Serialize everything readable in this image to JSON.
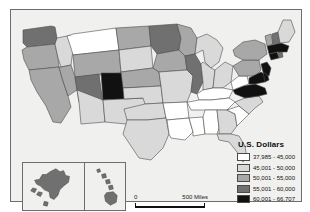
{
  "figure": {
    "background_color": "#ffffff",
    "map_background_color": "#f0f0ee",
    "frame_color": "#6d6d6d"
  },
  "legend": {
    "title": "U.S. Dollars",
    "classes": [
      {
        "label": "37,985 - 45,000",
        "color": "#ffffff",
        "min": 37985,
        "max": 45000
      },
      {
        "label": "45,001 - 50,000",
        "color": "#d9d9d9",
        "min": 45001,
        "max": 50000
      },
      {
        "label": "50,001 - 55,000",
        "color": "#a8a8a8",
        "min": 50001,
        "max": 55000
      },
      {
        "label": "55,001 - 60,000",
        "color": "#707070",
        "min": 55001,
        "max": 60000
      },
      {
        "label": "60,001 - 66,707",
        "color": "#111111",
        "min": 60001,
        "max": 66707
      }
    ]
  },
  "scale_bar": {
    "zero_label": "0",
    "max_label": "500 Miles",
    "units": "Miles",
    "max_value": 500
  },
  "chart_data": {
    "type": "choropleth",
    "title": "U.S. Dollars",
    "value_label": "U.S. Dollars",
    "classification": "5-class graduated grayscale",
    "data_min": 37985,
    "data_max": 66707,
    "class_breaks": [
      37985,
      45000,
      50000,
      55000,
      60000,
      66707
    ],
    "class_colors": [
      "#ffffff",
      "#d9d9d9",
      "#a8a8a8",
      "#707070",
      "#111111"
    ],
    "insets": [
      "Alaska",
      "Hawaii"
    ],
    "states": [
      {
        "code": "WA",
        "name": "Washington",
        "class": 4,
        "color": "#707070"
      },
      {
        "code": "OR",
        "name": "Oregon",
        "class": 3,
        "color": "#a8a8a8"
      },
      {
        "code": "CA",
        "name": "California",
        "class": 3,
        "color": "#a8a8a8"
      },
      {
        "code": "NV",
        "name": "Nevada",
        "class": 3,
        "color": "#a8a8a8"
      },
      {
        "code": "ID",
        "name": "Idaho",
        "class": 2,
        "color": "#d9d9d9"
      },
      {
        "code": "MT",
        "name": "Montana",
        "class": 1,
        "color": "#ffffff"
      },
      {
        "code": "WY",
        "name": "Wyoming",
        "class": 3,
        "color": "#a8a8a8"
      },
      {
        "code": "UT",
        "name": "Utah",
        "class": 4,
        "color": "#707070"
      },
      {
        "code": "AZ",
        "name": "Arizona",
        "class": 2,
        "color": "#d9d9d9"
      },
      {
        "code": "CO",
        "name": "Colorado",
        "class": 5,
        "color": "#111111"
      },
      {
        "code": "NM",
        "name": "New Mexico",
        "class": 2,
        "color": "#d9d9d9"
      },
      {
        "code": "ND",
        "name": "North Dakota",
        "class": 3,
        "color": "#a8a8a8"
      },
      {
        "code": "SD",
        "name": "South Dakota",
        "class": 2,
        "color": "#d9d9d9"
      },
      {
        "code": "NE",
        "name": "Nebraska",
        "class": 3,
        "color": "#a8a8a8"
      },
      {
        "code": "KS",
        "name": "Kansas",
        "class": 2,
        "color": "#d9d9d9"
      },
      {
        "code": "OK",
        "name": "Oklahoma",
        "class": 2,
        "color": "#d9d9d9"
      },
      {
        "code": "TX",
        "name": "Texas",
        "class": 2,
        "color": "#d9d9d9"
      },
      {
        "code": "MN",
        "name": "Minnesota",
        "class": 4,
        "color": "#707070"
      },
      {
        "code": "IA",
        "name": "Iowa",
        "class": 3,
        "color": "#a8a8a8"
      },
      {
        "code": "MO",
        "name": "Missouri",
        "class": 2,
        "color": "#d9d9d9"
      },
      {
        "code": "AR",
        "name": "Arkansas",
        "class": 1,
        "color": "#ffffff"
      },
      {
        "code": "LA",
        "name": "Louisiana",
        "class": 1,
        "color": "#ffffff"
      },
      {
        "code": "WI",
        "name": "Wisconsin",
        "class": 3,
        "color": "#a8a8a8"
      },
      {
        "code": "IL",
        "name": "Illinois",
        "class": 4,
        "color": "#707070"
      },
      {
        "code": "MS",
        "name": "Mississippi",
        "class": 1,
        "color": "#ffffff"
      },
      {
        "code": "MI",
        "name": "Michigan",
        "class": 2,
        "color": "#d9d9d9"
      },
      {
        "code": "IN",
        "name": "Indiana",
        "class": 2,
        "color": "#d9d9d9"
      },
      {
        "code": "OH",
        "name": "Ohio",
        "class": 2,
        "color": "#d9d9d9"
      },
      {
        "code": "KY",
        "name": "Kentucky",
        "class": 1,
        "color": "#ffffff"
      },
      {
        "code": "TN",
        "name": "Tennessee",
        "class": 1,
        "color": "#ffffff"
      },
      {
        "code": "AL",
        "name": "Alabama",
        "class": 1,
        "color": "#ffffff"
      },
      {
        "code": "GA",
        "name": "Georgia",
        "class": 2,
        "color": "#d9d9d9"
      },
      {
        "code": "FL",
        "name": "Florida",
        "class": 2,
        "color": "#d9d9d9"
      },
      {
        "code": "SC",
        "name": "South Carolina",
        "class": 1,
        "color": "#ffffff"
      },
      {
        "code": "NC",
        "name": "North Carolina",
        "class": 2,
        "color": "#d9d9d9"
      },
      {
        "code": "VA",
        "name": "Virginia",
        "class": 5,
        "color": "#111111"
      },
      {
        "code": "WV",
        "name": "West Virginia",
        "class": 1,
        "color": "#ffffff"
      },
      {
        "code": "PA",
        "name": "Pennsylvania",
        "class": 3,
        "color": "#a8a8a8"
      },
      {
        "code": "NY",
        "name": "New York",
        "class": 3,
        "color": "#a8a8a8"
      },
      {
        "code": "MD",
        "name": "Maryland",
        "class": 5,
        "color": "#111111"
      },
      {
        "code": "DE",
        "name": "Delaware",
        "class": 5,
        "color": "#111111"
      },
      {
        "code": "NJ",
        "name": "New Jersey",
        "class": 5,
        "color": "#111111"
      },
      {
        "code": "CT",
        "name": "Connecticut",
        "class": 5,
        "color": "#111111"
      },
      {
        "code": "RI",
        "name": "Rhode Island",
        "class": 4,
        "color": "#707070"
      },
      {
        "code": "MA",
        "name": "Massachusetts",
        "class": 5,
        "color": "#111111"
      },
      {
        "code": "VT",
        "name": "Vermont",
        "class": 3,
        "color": "#a8a8a8"
      },
      {
        "code": "NH",
        "name": "New Hampshire",
        "class": 4,
        "color": "#707070"
      },
      {
        "code": "ME",
        "name": "Maine",
        "class": 2,
        "color": "#d9d9d9"
      },
      {
        "code": "AK",
        "name": "Alaska",
        "class": 4,
        "color": "#707070"
      },
      {
        "code": "HI",
        "name": "Hawaii",
        "class": 4,
        "color": "#707070"
      }
    ]
  }
}
